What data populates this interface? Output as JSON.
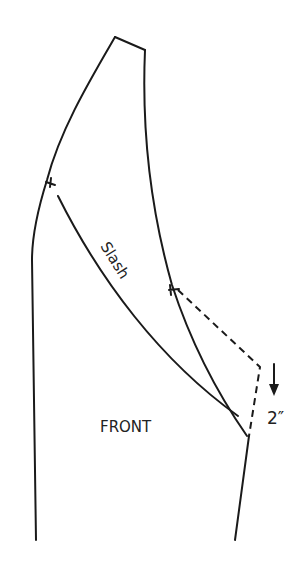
{
  "diagram": {
    "type": "sewing-pattern",
    "piece_label": "FRONT",
    "slash_label": "Slash",
    "measurement_label": "2″",
    "measurement_direction": "down",
    "colors": {
      "line": "#1a1a1a",
      "background": "#ffffff"
    }
  }
}
